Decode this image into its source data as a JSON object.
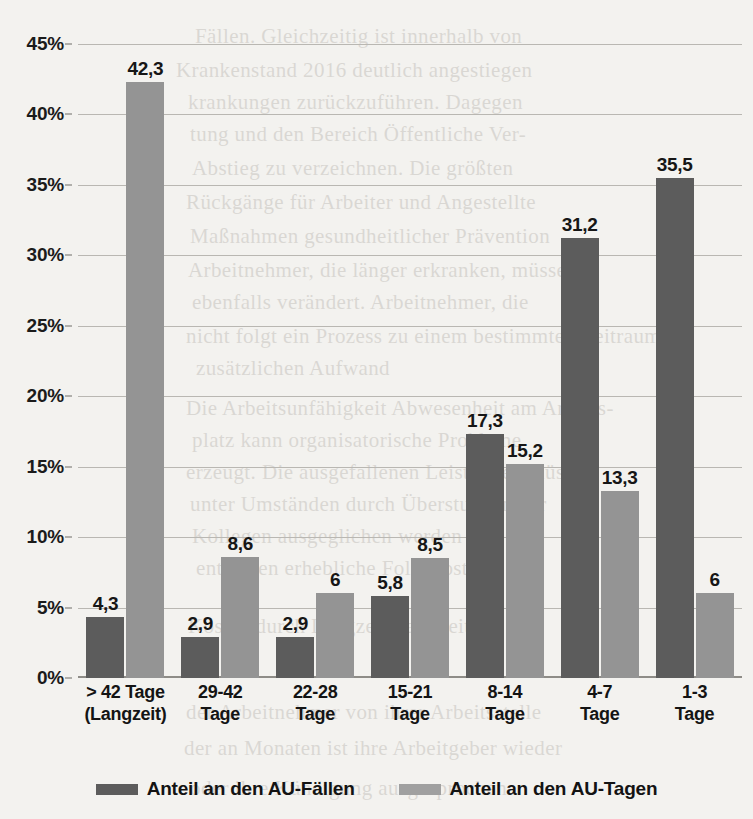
{
  "chart_data": {
    "type": "bar",
    "title": "",
    "subtitle": "",
    "xlabel": "",
    "ylabel": "",
    "ylim": [
      0,
      45
    ],
    "ytick_step": 5,
    "grid": true,
    "legend_position": "bottom",
    "categories": [
      "> 42 Tage (Langzeit)",
      "29-42 Tage",
      "22-28 Tage",
      "15-21 Tage",
      "8-14 Tage",
      "4-7 Tage",
      "1-3 Tage"
    ],
    "category_lines": [
      {
        "line1": "> 42 Tage",
        "line2": "(Langzeit)"
      },
      {
        "line1": "29-42",
        "line2": "Tage"
      },
      {
        "line1": "22-28",
        "line2": "Tage"
      },
      {
        "line1": "15-21",
        "line2": "Tage"
      },
      {
        "line1": "8-14",
        "line2": "Tage"
      },
      {
        "line1": "4-7",
        "line2": "Tage"
      },
      {
        "line1": "1-3",
        "line2": "Tage"
      }
    ],
    "ytick_labels": [
      "45%",
      "40%",
      "35%",
      "30%",
      "25%",
      "20%",
      "15%",
      "10%",
      "5%",
      "0%"
    ],
    "ytick_values": [
      45,
      40,
      35,
      30,
      25,
      20,
      15,
      10,
      5,
      0
    ],
    "series": [
      {
        "name": "Anteil an den AU-Fällen",
        "color": "#5c5c5c",
        "values": [
          4.3,
          2.9,
          2.9,
          5.8,
          17.3,
          31.2,
          35.5
        ],
        "labels": [
          "4,3",
          "2,9",
          "2,9",
          "5,8",
          "17,3",
          "31,2",
          "35,5"
        ]
      },
      {
        "name": "Anteil an den AU-Tagen",
        "color": "#949494",
        "values": [
          42.3,
          8.6,
          6.0,
          8.5,
          15.2,
          13.3,
          6.0
        ],
        "labels": [
          "42,3",
          "8,6",
          "6",
          "8,5",
          "15,2",
          "13,3",
          "6"
        ]
      }
    ]
  },
  "legend": {
    "items": [
      {
        "label": "Anteil an den AU-Fällen",
        "color": "#5c5c5c"
      },
      {
        "label": "Anteil an den AU-Tagen",
        "color": "#a0a0a0"
      }
    ]
  },
  "background_bleed": [
    {
      "text": "Fällen. Gleichzeitig ist innerhalb von",
      "x": 195,
      "y": 24
    },
    {
      "text": "Krankenstand 2016 deutlich angestiegen",
      "x": 176,
      "y": 58
    },
    {
      "text": "krankungen zurückzuführen. Dagegen",
      "x": 188,
      "y": 90
    },
    {
      "text": "tung und den Bereich Öffentliche Ver-",
      "x": 190,
      "y": 122
    },
    {
      "text": "Abstieg zu verzeichnen. Die größten",
      "x": 192,
      "y": 156
    },
    {
      "text": "Rückgänge für Arbeiter und Angestellte",
      "x": 186,
      "y": 190
    },
    {
      "text": "Maßnahmen gesundheitlicher Prävention",
      "x": 190,
      "y": 224
    },
    {
      "text": "Arbeitnehmer, die länger erkranken, müssen",
      "x": 188,
      "y": 258
    },
    {
      "text": "ebenfalls verändert. Arbeitnehmer, die",
      "x": 192,
      "y": 290
    },
    {
      "text": "nicht folgt ein Prozess zu einem bestimmten Zeitraum",
      "x": 186,
      "y": 324
    },
    {
      "text": "zusätzlichen Aufwand",
      "x": 196,
      "y": 356
    },
    {
      "text": "Die Arbeitsunfähigkeit Abwesenheit am Arbeits-",
      "x": 186,
      "y": 396
    },
    {
      "text": "platz kann organisatorische Probleme",
      "x": 192,
      "y": 428
    },
    {
      "text": "erzeugt. Die ausgefallenen Leistungen müssen",
      "x": 186,
      "y": 460
    },
    {
      "text": "unter Umständen durch Überstunden der",
      "x": 190,
      "y": 492
    },
    {
      "text": "Kollegen ausgeglichen werden und es",
      "x": 192,
      "y": 524
    },
    {
      "text": "entstehen erhebliche Folgekosten",
      "x": 196,
      "y": 556
    },
    {
      "text": "Kosten durch Langzeitkrankheiten",
      "x": 188,
      "y": 614
    },
    {
      "text": "der Arbeitnehmer von ihrer Arbeitsstelle",
      "x": 186,
      "y": 700
    },
    {
      "text": "der an Monaten ist ihre Arbeitgeber wieder",
      "x": 184,
      "y": 736
    },
    {
      "text": "oder ihre Kündigung ausgesprochen",
      "x": 190,
      "y": 776
    }
  ]
}
